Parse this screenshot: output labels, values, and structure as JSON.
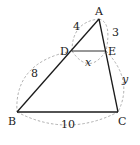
{
  "diagram": {
    "type": "geometry-triangle",
    "colors": {
      "line": "#1a1a1a",
      "dashed": "#9a9a9a",
      "text": "#222222",
      "background": "#ffffff"
    },
    "points": {
      "A": {
        "label": "A",
        "x": 99,
        "y": 19
      },
      "B": {
        "label": "B",
        "x": 17,
        "y": 112
      },
      "C": {
        "label": "C",
        "x": 118,
        "y": 112
      },
      "D": {
        "label": "D",
        "x": 72,
        "y": 51
      },
      "E": {
        "label": "E",
        "x": 106,
        "y": 51
      }
    },
    "segment_labels": {
      "AD": "4",
      "AE": "3",
      "DB": "8",
      "DE": "x",
      "EC": "y",
      "BC": "10"
    }
  }
}
